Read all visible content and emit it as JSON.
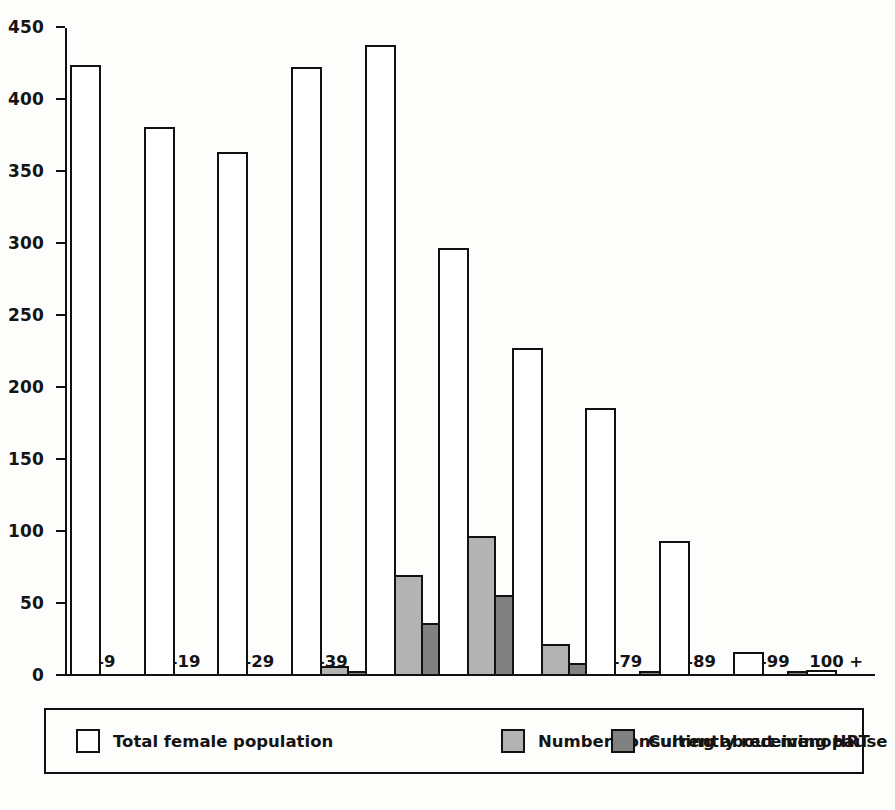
{
  "chart_data": {
    "type": "bar",
    "title": "",
    "subtitle": "",
    "xlabel": "",
    "ylabel": "",
    "ylim": [
      0,
      450
    ],
    "ytick_step": 50,
    "yticks": [
      "0",
      "50",
      "100",
      "150",
      "200",
      "250",
      "300",
      "350",
      "400",
      "450"
    ],
    "grid": false,
    "legend_position": "bottom",
    "categories": [
      "0–9",
      "10–19",
      "20–29",
      "30–39",
      "40–49",
      "50–59",
      "60–69",
      "70–79",
      "80–89",
      "90–99",
      "100 +"
    ],
    "series": [
      {
        "name": "Total female population",
        "color": "#ffffff",
        "values": [
          424,
          381,
          364,
          423,
          438,
          297,
          228,
          186,
          94,
          17,
          4
        ]
      },
      {
        "name": "Number consulting about menopause",
        "color": "#b3b3b3",
        "values": [
          0,
          0,
          0,
          7,
          70,
          97,
          22,
          0,
          0,
          0,
          0
        ]
      },
      {
        "name": "Currently receiving HRT",
        "color": "#808080",
        "values": [
          0,
          0,
          0,
          3,
          37,
          56,
          9,
          3,
          0,
          1,
          0
        ]
      }
    ]
  },
  "legend": {
    "items": [
      {
        "label": "Total female population",
        "swatch": "total"
      },
      {
        "label": "Number consulting about menopause",
        "swatch": "consulting"
      },
      {
        "label": "Currently receiving HRT",
        "swatch": "hrt"
      }
    ]
  }
}
